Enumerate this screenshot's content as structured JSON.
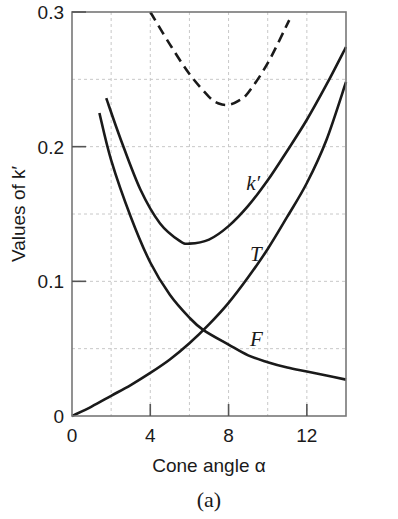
{
  "chart_data": {
    "type": "line",
    "title": "",
    "xlabel": "Cone angle α",
    "ylabel": "Values of k′",
    "caption": "(a)",
    "xlim": [
      0,
      14
    ],
    "ylim": [
      0,
      0.3
    ],
    "xticks": [
      0,
      4,
      8,
      12
    ],
    "xtick_labels": [
      "0",
      "4",
      "8",
      "12"
    ],
    "yticks": [
      0,
      0.1,
      0.2,
      0.3
    ],
    "ytick_labels": [
      "0",
      "0.1",
      "0.2",
      "0.3"
    ],
    "grid": true,
    "grid_style": "dashed",
    "grid_x": [
      2,
      4,
      6,
      8,
      10,
      12
    ],
    "grid_y": [
      0.05,
      0.1,
      0.15,
      0.2,
      0.25
    ],
    "legend": "none (inline curve labels)",
    "series": [
      {
        "name": "k′",
        "style": "solid",
        "label_pos": [
          8.9,
          0.168
        ],
        "x": [
          1.75,
          2.5,
          3.5,
          4.5,
          5.5,
          6.0,
          7.0,
          8.0,
          9.0,
          10.0,
          11.0,
          12.0,
          13.0,
          14.0
        ],
        "y": [
          0.236,
          0.205,
          0.168,
          0.143,
          0.13,
          0.128,
          0.131,
          0.141,
          0.156,
          0.175,
          0.197,
          0.22,
          0.246,
          0.274
        ]
      },
      {
        "name": "T",
        "style": "solid",
        "label_pos": [
          9.1,
          0.115
        ],
        "x": [
          0,
          1,
          2,
          3,
          4,
          5,
          6,
          7,
          8,
          9,
          10,
          11,
          12,
          13,
          14
        ],
        "y": [
          0.0,
          0.007,
          0.015,
          0.023,
          0.032,
          0.042,
          0.054,
          0.068,
          0.084,
          0.103,
          0.124,
          0.148,
          0.173,
          0.205,
          0.248
        ]
      },
      {
        "name": "F",
        "style": "solid",
        "label_pos": [
          9.1,
          0.052
        ],
        "x": [
          1.4,
          2.0,
          3.0,
          4.0,
          5.0,
          6.0,
          6.7,
          8.0,
          9.0,
          10.0,
          11.0,
          12.0,
          13.0,
          14.0
        ],
        "y": [
          0.225,
          0.19,
          0.148,
          0.114,
          0.09,
          0.073,
          0.064,
          0.053,
          0.045,
          0.04,
          0.036,
          0.033,
          0.03,
          0.027
        ]
      },
      {
        "name": "upper bound (dashed)",
        "style": "dashed",
        "x": [
          4.0,
          5.0,
          6.0,
          7.0,
          7.5,
          8.0,
          8.5,
          9.0,
          10.0,
          11.1
        ],
        "y": [
          0.3,
          0.276,
          0.254,
          0.237,
          0.232,
          0.231,
          0.234,
          0.24,
          0.262,
          0.294
        ]
      }
    ]
  }
}
